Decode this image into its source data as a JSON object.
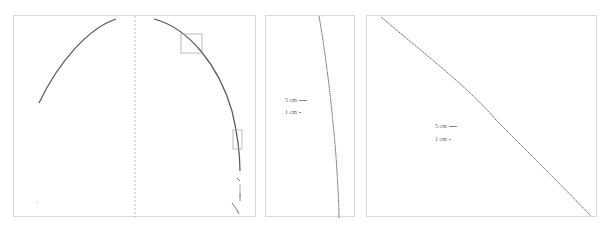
{
  "figure": {
    "panels": [
      {
        "id": "overview",
        "description": "Full arch curve with dashed center axis and two inset boxes",
        "inset_boxes": 2
      },
      {
        "id": "zoom-near-vertical",
        "scale_bars": [
          {
            "label": "5 cm"
          },
          {
            "label": "1 cm"
          }
        ]
      },
      {
        "id": "zoom-diagonal",
        "scale_bars": [
          {
            "label": "5 cm"
          },
          {
            "label": "1 cm"
          }
        ]
      }
    ],
    "colors": {
      "curve": "#555555",
      "frame": "#d9d9d9",
      "axis": "#bbbbbb",
      "inset": "#aaaaaa"
    }
  }
}
